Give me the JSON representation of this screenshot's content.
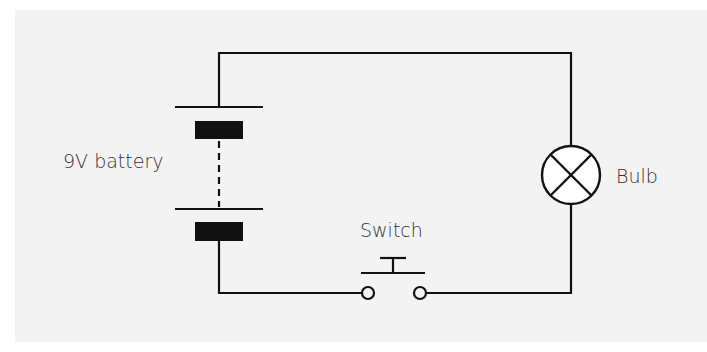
{
  "diagram": {
    "type": "circuit-diagram",
    "background_color": "#f3f3f3",
    "wire_color": "#111111",
    "text_color": "#333333",
    "components": [
      {
        "id": "battery",
        "symbol": "battery-multi-cell",
        "label": "9V battery"
      },
      {
        "id": "switch",
        "symbol": "push-button-switch-open",
        "label": "Switch"
      },
      {
        "id": "bulb",
        "symbol": "lamp",
        "label": "Bulb"
      }
    ],
    "labels": {
      "battery": "9V battery",
      "switch": "Switch",
      "bulb": "Bulb"
    }
  }
}
